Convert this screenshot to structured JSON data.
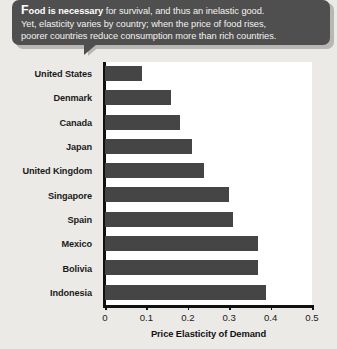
{
  "callout": {
    "lead_initial": "F",
    "lead_rest": "ood is necessary",
    "line1_rest": " for survival, and thus an inelastic good.",
    "line2": "Yet, elasticity varies by country; when the price of food rises,",
    "line3": "poorer countries reduce consumption more than rich countries.",
    "background_color": "#4f4f4f",
    "text_color": "#f2f1ef"
  },
  "chart_data": {
    "type": "bar",
    "orientation": "horizontal",
    "title": "",
    "xlabel": "Price Elasticity of Demand",
    "ylabel": "",
    "categories": [
      "United States",
      "Denmark",
      "Canada",
      "Japan",
      "United Kingdom",
      "Singapore",
      "Spain",
      "Mexico",
      "Bolivia",
      "Indonesia"
    ],
    "values": [
      0.09,
      0.16,
      0.18,
      0.21,
      0.24,
      0.3,
      0.31,
      0.37,
      0.37,
      0.39
    ],
    "xlim": [
      0,
      0.5
    ],
    "xticks": [
      0,
      0.1,
      0.2,
      0.3,
      0.4,
      0.5
    ],
    "xtick_labels": [
      "0",
      "0.1",
      "0.2",
      "0.3",
      "0.4",
      "0.5"
    ],
    "grid": false,
    "legend": false,
    "bar_color": "#454545",
    "plot_background": "#ffffff"
  },
  "page": {
    "background_color": "#eceae7"
  }
}
